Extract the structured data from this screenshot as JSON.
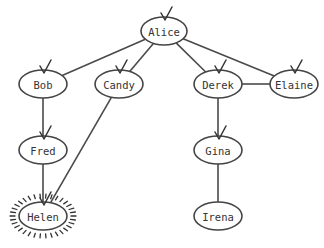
{
  "diagram": {
    "type": "tree-graph",
    "nodes": [
      {
        "id": "alice",
        "label": "Alice",
        "x": 164,
        "y": 31,
        "rx": 23,
        "ry": 14,
        "checked": true,
        "highlighted": false
      },
      {
        "id": "bob",
        "label": "Bob",
        "x": 43,
        "y": 84,
        "rx": 24,
        "ry": 14,
        "checked": true,
        "highlighted": false
      },
      {
        "id": "candy",
        "label": "Candy",
        "x": 119,
        "y": 84,
        "rx": 24,
        "ry": 14,
        "checked": true,
        "highlighted": false
      },
      {
        "id": "derek",
        "label": "Derek",
        "x": 218,
        "y": 84,
        "rx": 24,
        "ry": 14,
        "checked": true,
        "highlighted": false
      },
      {
        "id": "elaine",
        "label": "Elaine",
        "x": 294,
        "y": 84,
        "rx": 24,
        "ry": 14,
        "checked": true,
        "highlighted": false
      },
      {
        "id": "fred",
        "label": "Fred",
        "x": 43,
        "y": 150,
        "rx": 24,
        "ry": 14,
        "checked": true,
        "highlighted": false
      },
      {
        "id": "gina",
        "label": "Gina",
        "x": 218,
        "y": 150,
        "rx": 24,
        "ry": 14,
        "checked": true,
        "highlighted": false
      },
      {
        "id": "helen",
        "label": "Helen",
        "x": 43,
        "y": 216,
        "rx": 24,
        "ry": 14,
        "checked": true,
        "highlighted": true
      },
      {
        "id": "irena",
        "label": "Irena",
        "x": 218,
        "y": 216,
        "rx": 24,
        "ry": 14,
        "checked": false,
        "highlighted": false
      }
    ],
    "edges": [
      {
        "from": "alice",
        "to": "bob"
      },
      {
        "from": "alice",
        "to": "candy"
      },
      {
        "from": "alice",
        "to": "derek"
      },
      {
        "from": "alice",
        "to": "elaine"
      },
      {
        "from": "derek",
        "to": "elaine"
      },
      {
        "from": "bob",
        "to": "fred"
      },
      {
        "from": "fred",
        "to": "helen"
      },
      {
        "from": "candy",
        "to": "helen"
      },
      {
        "from": "derek",
        "to": "gina"
      },
      {
        "from": "gina",
        "to": "irena"
      }
    ]
  },
  "colors": {
    "stroke": "#444444",
    "text": "#333333",
    "background": "#ffffff"
  }
}
